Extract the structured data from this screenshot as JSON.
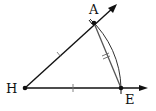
{
  "diagram": {
    "type": "geometric-construction",
    "points": [
      {
        "id": "H",
        "label": "H"
      },
      {
        "id": "A",
        "label": "A"
      },
      {
        "id": "E",
        "label": "E"
      }
    ],
    "segments": [
      {
        "from": "H",
        "to": "A",
        "kind": "ray",
        "tick_marks": 1
      },
      {
        "from": "H",
        "to": "E",
        "kind": "ray",
        "tick_marks": 1
      },
      {
        "from": "A",
        "to": "E",
        "kind": "segment",
        "tick_marks": 2
      }
    ],
    "arcs": [
      {
        "center": "H",
        "from": "A",
        "to": "E"
      }
    ],
    "colors": {
      "stroke": "#111111",
      "segment_ae": "#555555"
    }
  }
}
